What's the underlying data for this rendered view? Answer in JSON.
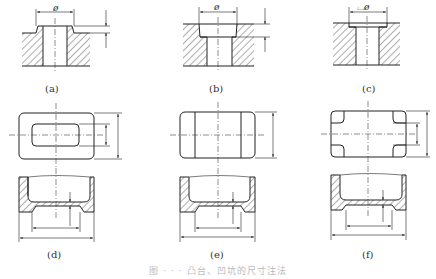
{
  "figure": {
    "panels": [
      {
        "id": "a",
        "label": "(a)",
        "description": "Boss (raised) with through-hole: diameter Ø and boss height dimensioned"
      },
      {
        "id": "b",
        "label": "(b)",
        "description": "Counterbore: counterbore diameter Ø and depth dimensioned"
      },
      {
        "id": "c",
        "label": "(c)",
        "description": "Spot face: ⌴Ø diameter dimensioned"
      },
      {
        "id": "d",
        "label": "(d)",
        "description": "Rectangular pit with rounded-rectangle recess, plan + section with dimensions"
      },
      {
        "id": "e",
        "label": "(e)",
        "description": "Rectangular pit with through-slot band, plan + section with dimensions"
      },
      {
        "id": "f",
        "label": "(f)",
        "description": "Rectangular pit with four corner recesses, plan + section with dimensions"
      }
    ],
    "dimension_symbols": {
      "diameter": "ø",
      "spotface_diameter": "⌴ø"
    },
    "caption": "图 · · · 凸台、凹坑的尺寸注法"
  },
  "colors": {
    "line": "#222222",
    "hatch": "#333333",
    "centerline": "#444444",
    "background": "#ffffff"
  }
}
